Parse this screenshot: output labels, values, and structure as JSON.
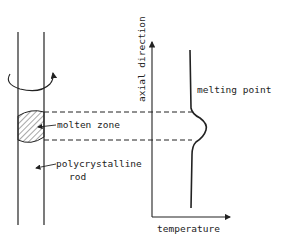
{
  "diagram": {
    "labels": {
      "axial_direction": "axial direction",
      "melting_point": "melting point",
      "molten_zone": "molten zone",
      "polycrystalline_line1": "polycrystalline",
      "polycrystalline_line2": "rod",
      "temperature": "temperature"
    },
    "colors": {
      "stroke": "#222222",
      "background": "#ffffff"
    }
  }
}
